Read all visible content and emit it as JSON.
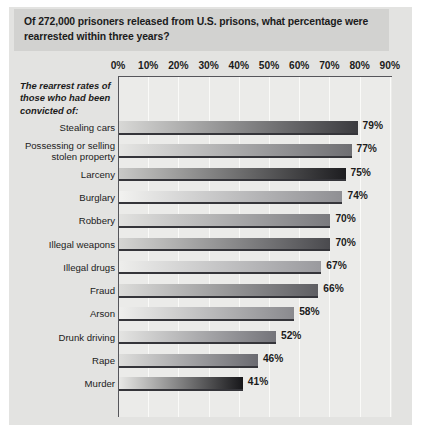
{
  "title": "Of 272,000 prisoners released from U.S. prisons, what percentage were rearrested within three years?",
  "caption": "The rearrest rates of those who had been convicted of:",
  "chart_data": {
    "type": "bar",
    "orientation": "horizontal",
    "title": "Of 272,000 prisoners released from U.S. prisons, what percentage were rearrested within three years?",
    "xlabel": "",
    "ylabel": "The rearrest rates of those who had been convicted of:",
    "xlim": [
      0,
      95
    ],
    "grid": true,
    "legend": "none",
    "tick_labels": [
      "0%",
      "10%",
      "20%",
      "30%",
      "40%",
      "50%",
      "60%",
      "70%",
      "80%",
      "90%"
    ],
    "ticks": [
      0,
      10,
      20,
      30,
      40,
      50,
      60,
      70,
      80,
      90
    ],
    "categories": [
      "Stealing cars",
      "Possessing or selling stolen property",
      "Larceny",
      "Burglary",
      "Robbery",
      "Illegal weapons",
      "Illegal drugs",
      "Fraud",
      "Arson",
      "Drunk driving",
      "Rape",
      "Murder"
    ],
    "values": [
      79,
      77,
      75,
      74,
      70,
      70,
      67,
      66,
      58,
      52,
      46,
      41
    ],
    "value_labels": [
      "79%",
      "77%",
      "75%",
      "74%",
      "70%",
      "70%",
      "67%",
      "66%",
      "58%",
      "52%",
      "46%",
      "41%"
    ],
    "bars": [
      {
        "label": "Stealing cars",
        "value": 79,
        "value_label": "79%",
        "label_lines": [
          "Stealing cars"
        ],
        "shade_start": "#d8d8d6",
        "shade_end": "#3b3b3f"
      },
      {
        "label": "Possessing or selling stolen property",
        "value": 77,
        "value_label": "77%",
        "label_lines": [
          "Possessing or selling",
          "stolen property"
        ],
        "shade_start": "#e6e6e4",
        "shade_end": "#6e6e72"
      },
      {
        "label": "Larceny",
        "value": 75,
        "value_label": "75%",
        "label_lines": [
          "Larceny"
        ],
        "shade_start": "#c9c9c7",
        "shade_end": "#1d1d20"
      },
      {
        "label": "Burglary",
        "value": 74,
        "value_label": "74%",
        "label_lines": [
          "Burglary"
        ],
        "shade_start": "#f2f2f0",
        "shade_end": "#8f8f93"
      },
      {
        "label": "Robbery",
        "value": 70,
        "value_label": "70%",
        "label_lines": [
          "Robbery"
        ],
        "shade_start": "#e2e2e0",
        "shade_end": "#7a7a7e"
      },
      {
        "label": "Illegal weapons",
        "value": 70,
        "value_label": "70%",
        "label_lines": [
          "Illegal weapons"
        ],
        "shade_start": "#d5d5d3",
        "shade_end": "#4a4a4e"
      },
      {
        "label": "Illegal drugs",
        "value": 67,
        "value_label": "67%",
        "label_lines": [
          "Illegal drugs"
        ],
        "shade_start": "#eeeeec",
        "shade_end": "#9a9a9e"
      },
      {
        "label": "Fraud",
        "value": 66,
        "value_label": "66%",
        "label_lines": [
          "Fraud"
        ],
        "shade_start": "#dcdcda",
        "shade_end": "#5e5e62"
      },
      {
        "label": "Arson",
        "value": 58,
        "value_label": "58%",
        "label_lines": [
          "Arson"
        ],
        "shade_start": "#efefed",
        "shade_end": "#8a8a8e"
      },
      {
        "label": "Drunk driving",
        "value": 52,
        "value_label": "52%",
        "label_lines": [
          "Drunk driving"
        ],
        "shade_start": "#e4e4e2",
        "shade_end": "#74747a"
      },
      {
        "label": "Rape",
        "value": 46,
        "value_label": "46%",
        "label_lines": [
          "Rape"
        ],
        "shade_start": "#dededc",
        "shade_end": "#6a6a70"
      },
      {
        "label": "Murder",
        "value": 41,
        "value_label": "41%",
        "label_lines": [
          "Murder"
        ],
        "shade_start": "#e8e8e6",
        "shade_end": "#17171a"
      }
    ]
  }
}
